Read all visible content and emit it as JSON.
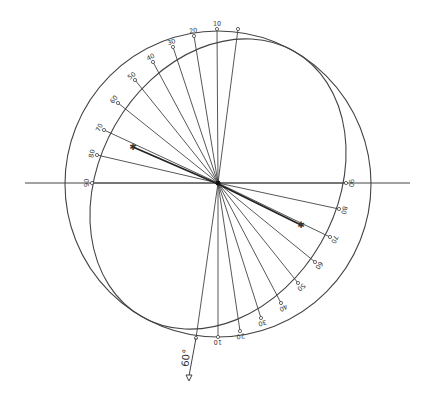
{
  "diagram": {
    "type": "stereographic-projection",
    "colors": {
      "line": "#444444",
      "background": "#ffffff"
    },
    "primitive_circle": {
      "cx": 218,
      "cy": 184,
      "r": 153
    },
    "horizontal_axis": {
      "x1": 25,
      "x2": 410,
      "y": 183
    },
    "great_circle": {
      "cx": 218,
      "cy": 184,
      "rx": 153,
      "ry": 118.6,
      "tilt_deg": -60
    },
    "plunge_label": "60°",
    "plunge_line": {
      "x1": 196,
      "y1": 338,
      "x2": 189,
      "y2": 376
    },
    "upper_ticks": [
      {
        "label": "",
        "x": 238,
        "y": 29
      },
      {
        "label": "10",
        "x": 217,
        "y": 29
      },
      {
        "label": "20",
        "x": 194,
        "y": 36
      },
      {
        "label": "30",
        "x": 173,
        "y": 47
      },
      {
        "label": "40",
        "x": 153,
        "y": 62
      },
      {
        "label": "50",
        "x": 135,
        "y": 80
      },
      {
        "label": "60",
        "x": 118,
        "y": 103
      },
      {
        "label": "70",
        "x": 104,
        "y": 130
      },
      {
        "label": "80",
        "x": 97,
        "y": 155
      },
      {
        "label": "90",
        "x": 92,
        "y": 183
      }
    ],
    "lower_ticks": [
      {
        "label": "",
        "x": 196,
        "y": 338
      },
      {
        "label": "10",
        "x": 218,
        "y": 337
      },
      {
        "label": "20",
        "x": 240,
        "y": 331
      },
      {
        "label": "30",
        "x": 261,
        "y": 318
      },
      {
        "label": "40",
        "x": 281,
        "y": 303
      },
      {
        "label": "50",
        "x": 298,
        "y": 283
      },
      {
        "label": "60",
        "x": 315,
        "y": 262
      },
      {
        "label": "70",
        "x": 330,
        "y": 237
      },
      {
        "label": "80",
        "x": 339,
        "y": 209
      },
      {
        "label": "90",
        "x": 346,
        "y": 183
      }
    ],
    "pole_marks": [
      {
        "name": "upper-pole",
        "x": 133,
        "y": 147
      },
      {
        "name": "lower-pole",
        "x": 301,
        "y": 225
      }
    ]
  }
}
